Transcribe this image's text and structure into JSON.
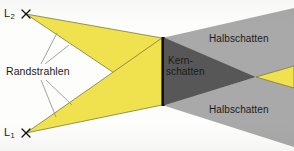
{
  "diagram": {
    "language": "de",
    "width": 294,
    "height": 151
  },
  "colors": {
    "light_beam": "#f0e24f",
    "light_beam_stroke": "#6b6a2a",
    "penumbra": "#a9a9a9",
    "umbra": "#575757",
    "background": "#fdfdfb",
    "obstacle": "#101010",
    "text": "#1a1a1a",
    "ray_line": "#8a8a8a"
  },
  "labels": {
    "source_top": "L",
    "source_top_sub": "2",
    "source_bottom": "L",
    "source_bottom_sub": "1",
    "edge_rays": "Randstrahlen",
    "umbra_line1": "Kern-",
    "umbra_line2": "schatten",
    "penumbra_top": "Halbschatten",
    "penumbra_bottom": "Halbschatten"
  },
  "markers": {
    "source_glyph": "✕"
  },
  "geometry": {
    "source_top": [
      26,
      14
    ],
    "source_bottom": [
      26,
      133
    ],
    "obstacle": {
      "x": 162,
      "y_top": 38,
      "y_bottom": 105,
      "width": 3
    },
    "umbra_tip": [
      256,
      77
    ]
  }
}
